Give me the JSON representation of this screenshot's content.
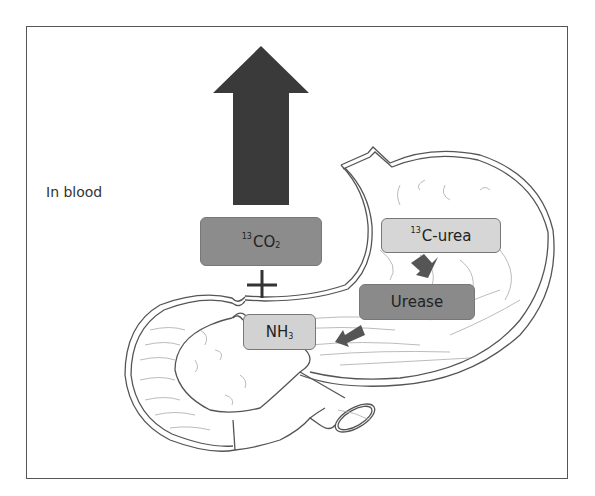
{
  "diagram": {
    "title_label": "In blood",
    "nodes": {
      "co2": {
        "sup": "13",
        "main": "CO",
        "sub": "2",
        "fill": "#8c8c8c"
      },
      "urea": {
        "sup": "13",
        "main": "C-urea",
        "fill": "#d6d6d6"
      },
      "urease": {
        "main": "Urease",
        "fill": "#8a8a8a"
      },
      "nh3": {
        "main": "NH",
        "sub": "3",
        "fill": "#d2d2d2"
      }
    },
    "plus_sign": "+",
    "arrows": [
      {
        "from": "co2",
        "to": "out-of-blood",
        "direction": "up",
        "size": "large",
        "color": "#3a3a3a"
      },
      {
        "from": "urea",
        "to": "urease",
        "direction": "down-left",
        "color": "#555555"
      },
      {
        "from": "urease",
        "to": "nh3",
        "direction": "down-left",
        "color": "#555555"
      }
    ],
    "illustration": "stomach-and-duodenum"
  }
}
